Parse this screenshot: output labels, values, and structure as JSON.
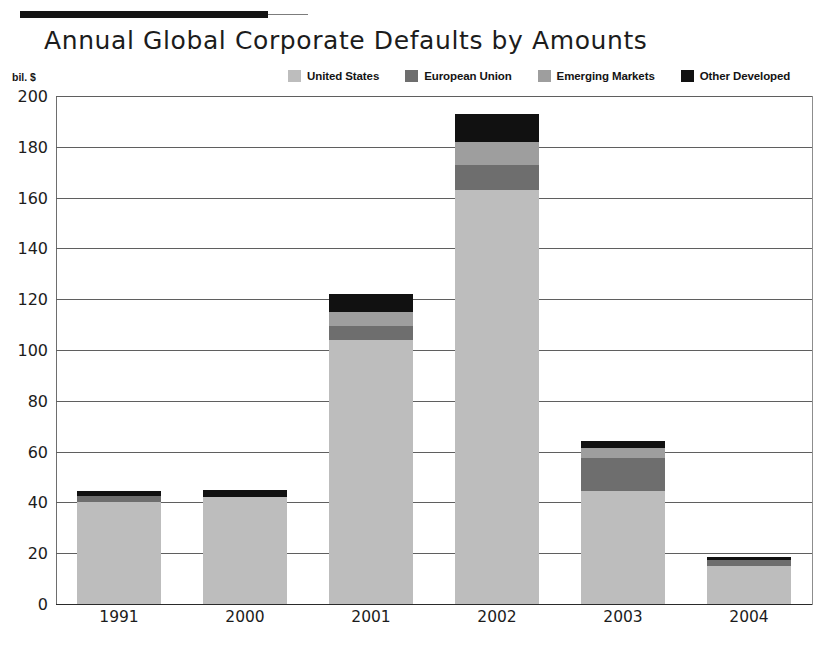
{
  "header": {
    "rule": "top-rule"
  },
  "chart_data": {
    "type": "bar",
    "title": "Annual Global Corporate Defaults by Amounts",
    "stacked": true,
    "xlabel": "",
    "ylabel": "",
    "yunit": "bil. $",
    "ylim": [
      0,
      200
    ],
    "ytick_step": 20,
    "yticks": [
      "200",
      "180",
      "160",
      "140",
      "120",
      "100",
      "80",
      "60",
      "40",
      "20",
      "0"
    ],
    "grid": true,
    "legend_position": "top-right",
    "categories": [
      "1991",
      "2000",
      "2001",
      "2002",
      "2003",
      "2004"
    ],
    "series": [
      {
        "name": "United States",
        "color": "#bdbdbd",
        "values": [
          40,
          42,
          104,
          163,
          44.5,
          15
        ]
      },
      {
        "name": "European Union",
        "color": "#6e6e6e",
        "values": [
          2.5,
          0,
          5.5,
          10,
          13,
          2.5
        ]
      },
      {
        "name": "Emerging Markets",
        "color": "#9e9e9e",
        "values": [
          0,
          0,
          5.5,
          9,
          4,
          0
        ]
      },
      {
        "name": "Other Developed",
        "color": "#111111",
        "values": [
          2,
          3,
          7,
          11,
          2.5,
          1
        ]
      }
    ],
    "totals": [
      44.5,
      45,
      122,
      193,
      64,
      18.5
    ]
  },
  "colors": {
    "united_states": "#bdbdbd",
    "european_union": "#6e6e6e",
    "emerging_markets": "#9e9e9e",
    "other_developed": "#111111",
    "gridline": "#5f5f5f",
    "text": "#1c1c1c",
    "rule": "#141414"
  }
}
